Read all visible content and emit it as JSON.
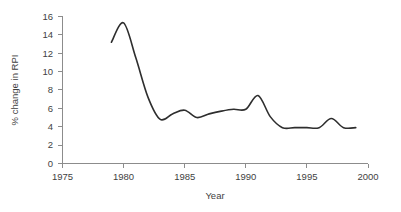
{
  "chart_data": {
    "type": "line",
    "title": "",
    "xlabel": "Year",
    "ylabel": "% change in RPI",
    "xlim": [
      1975,
      2000
    ],
    "ylim": [
      0,
      16
    ],
    "grid": false,
    "legend": false,
    "x_ticks": [
      "1975",
      "1980",
      "1985",
      "1990",
      "1995",
      "2000"
    ],
    "y_ticks": [
      "0",
      "2",
      "4",
      "6",
      "8",
      "10",
      "12",
      "14",
      "16"
    ],
    "x": [
      1979,
      1980,
      1981,
      1982,
      1983,
      1984,
      1985,
      1986,
      1987,
      1988,
      1989,
      1990,
      1991,
      1992,
      1993,
      1994,
      1995,
      1996,
      1997,
      1998,
      1999
    ],
    "values": [
      13.2,
      15.3,
      11.5,
      7.2,
      4.8,
      5.4,
      5.8,
      5.0,
      5.4,
      5.7,
      5.9,
      5.9,
      7.4,
      5.1,
      3.9,
      3.9,
      3.9,
      3.9,
      4.9,
      3.9,
      3.9
    ],
    "series": [
      {
        "name": "% change in RPI",
        "values": [
          13.2,
          15.3,
          11.5,
          7.2,
          4.8,
          5.4,
          5.8,
          5.0,
          5.4,
          5.7,
          5.9,
          5.9,
          7.4,
          5.1,
          3.9,
          3.9,
          3.9,
          3.9,
          4.9,
          3.9,
          3.9
        ],
        "color": "#2e2e2e"
      }
    ],
    "line_color": "#2e2e2e",
    "axis_color": "#8c8c8c",
    "background_color": "#ffffff",
    "annotations": []
  }
}
